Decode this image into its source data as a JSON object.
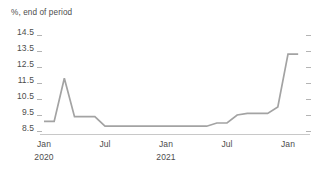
{
  "chart_data": {
    "type": "line",
    "title": "%, end of period",
    "xlabel": "",
    "ylabel": "",
    "ylim": [
      8.5,
      14.5
    ],
    "yticks": [
      14.5,
      13.5,
      12.5,
      11.5,
      10.5,
      9.5,
      8.5
    ],
    "ytick_labels": [
      "14.5",
      "13.5",
      "12.5",
      "11.5",
      "10.5",
      "9.5",
      "8.5"
    ],
    "grid": false,
    "legend": null,
    "x_axis": {
      "tick_labels": [
        "Jan",
        "Jul",
        "Jan",
        "Jul",
        "Jan"
      ],
      "tick_sublabels": [
        "2020",
        "",
        "2021",
        "",
        ""
      ],
      "range": [
        "2020-01",
        "2022-02"
      ]
    },
    "series": [
      {
        "name": "series-1",
        "color": "#a3a3a3",
        "x": [
          "2020-01",
          "2020-02",
          "2020-03",
          "2020-04",
          "2020-05",
          "2020-06",
          "2020-07",
          "2020-08",
          "2020-09",
          "2020-10",
          "2020-11",
          "2020-12",
          "2021-01",
          "2021-02",
          "2021-03",
          "2021-04",
          "2021-05",
          "2021-06",
          "2021-07",
          "2021-08",
          "2021-09",
          "2021-10",
          "2021-11",
          "2021-12",
          "2022-01",
          "2022-02"
        ],
        "values": [
          9.1,
          9.1,
          11.8,
          9.4,
          9.4,
          9.4,
          8.8,
          8.8,
          8.8,
          8.8,
          8.8,
          8.8,
          8.8,
          8.8,
          8.8,
          8.8,
          8.8,
          9.0,
          9.0,
          9.5,
          9.6,
          9.6,
          9.6,
          10.0,
          13.3,
          13.3
        ]
      }
    ]
  }
}
